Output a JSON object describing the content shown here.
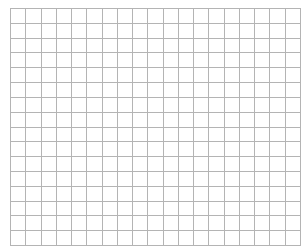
{
  "grid": {
    "columns": 19,
    "rows": 16,
    "line_color": "#b4b4b4",
    "background": "#ffffff"
  }
}
